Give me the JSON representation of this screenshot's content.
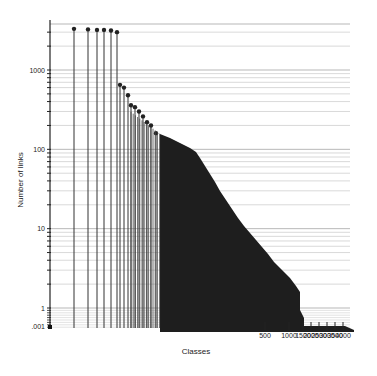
{
  "chart_data": {
    "type": "bar",
    "title": "",
    "xlabel": "Classes",
    "ylabel": "Number of links",
    "yscale": "log",
    "xscale": "log",
    "ylim": [
      0.001,
      3500
    ],
    "grid": true,
    "legend": null,
    "y_ticks": [
      {
        "value": 1000,
        "label": "1000"
      },
      {
        "value": 100,
        "label": "100"
      },
      {
        "value": 10,
        "label": "10"
      },
      {
        "value": 1,
        "label": "1"
      },
      {
        "value": 0.001,
        "label": ".001"
      }
    ],
    "x_ticks": [
      {
        "value": 500,
        "label": "500"
      },
      {
        "value": 1000,
        "label": "1000"
      },
      {
        "value": 1500,
        "label": "1500"
      },
      {
        "value": 2000,
        "label": "2000"
      },
      {
        "value": 2500,
        "label": "2500"
      },
      {
        "value": 3000,
        "label": "3000"
      },
      {
        "value": 3500,
        "label": "3500"
      },
      {
        "value": 4000,
        "label": "4000"
      }
    ],
    "x": [
      1,
      2,
      3,
      4,
      5,
      6,
      7,
      8,
      9,
      10,
      12,
      14,
      16,
      18,
      20,
      25,
      30,
      40,
      50,
      60,
      80,
      100,
      150,
      200,
      300,
      400,
      500,
      700,
      1000,
      1300,
      1500,
      2000,
      3000,
      4000
    ],
    "values": [
      3300,
      3250,
      3200,
      3200,
      3150,
      3000,
      650,
      600,
      480,
      360,
      340,
      300,
      260,
      220,
      200,
      160,
      130,
      115,
      110,
      95,
      60,
      40,
      25,
      15,
      9,
      6,
      4.5,
      3,
      2,
      1.3,
      1,
      0.001,
      0.001,
      0.001
    ]
  },
  "axes": {
    "x_title": "Classes",
    "y_title": "Number of links"
  }
}
